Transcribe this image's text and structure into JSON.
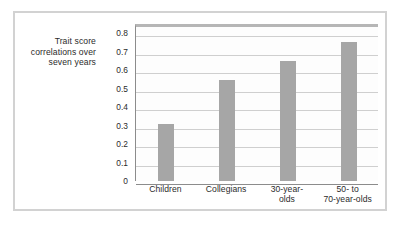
{
  "figure": {
    "name": "trait-score-correlation-bar-chart"
  },
  "axis_caption": {
    "line1": "Trait score",
    "line2": "correlations over",
    "line3": "seven years"
  },
  "colors": {
    "bar_fill": "#a6a6a6",
    "gridline": "#cfcfcf",
    "axis_line": "#8c8c8c",
    "frame": "#d2d2d2",
    "plot_top_band": "#b6b6b6",
    "text": "#2b2b2b",
    "background": "#ffffff"
  },
  "chart_data": {
    "type": "bar",
    "title": "",
    "subtitle": "",
    "xlabel": "",
    "ylabel": "Trait score correlations over seven years",
    "categories": [
      "Children",
      "Collegians",
      "30-year-olds",
      "50- to 70-year-olds"
    ],
    "category_label_lines": [
      [
        "Children"
      ],
      [
        "Collegians"
      ],
      [
        "30-year-",
        "olds"
      ],
      [
        "50- to",
        "70-year-olds"
      ]
    ],
    "values": [
      0.31,
      0.545,
      0.65,
      0.75
    ],
    "ylim": [
      0,
      0.85
    ],
    "ytick_values": [
      0.8,
      0.7,
      0.6,
      0.5,
      0.4,
      0.3,
      0.2,
      0.1,
      0
    ],
    "ytick_labels": [
      "0.8",
      "0.7",
      "0.6",
      "0.5",
      "0.4",
      "0.3",
      "0.2",
      "0.1",
      "0"
    ],
    "grid": true,
    "grid_axis": "y",
    "legend": false,
    "legend_position": "none",
    "bar_color": "#a6a6a6",
    "series": [
      {
        "name": "Trait score correlations over seven years",
        "values": [
          0.31,
          0.545,
          0.65,
          0.75
        ]
      }
    ]
  }
}
